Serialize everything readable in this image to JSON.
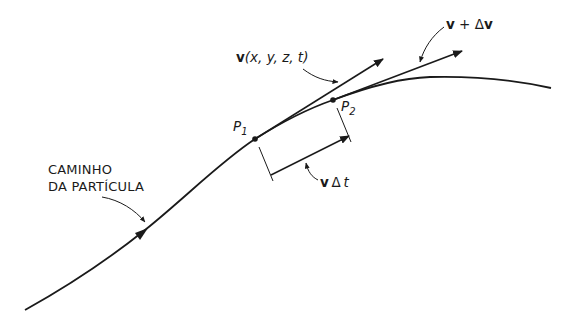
{
  "diagram": {
    "path_label_line1": "CAMINHO",
    "path_label_line2": "DA PARTÍCULA",
    "point1": {
      "name": "P",
      "sub": "1"
    },
    "point2": {
      "name": "P",
      "sub": "2"
    },
    "velocity_label": {
      "vec": "v",
      "args": "(x, y, z, t)"
    },
    "velocity_plus_label": {
      "vec1": "v",
      "op": " + Δ",
      "vec2": "v"
    },
    "displacement_label": {
      "vec": "v",
      "delta": "Δ",
      "t": "t"
    },
    "colors": {
      "line": "#1a1a1a",
      "background": "#ffffff"
    }
  }
}
